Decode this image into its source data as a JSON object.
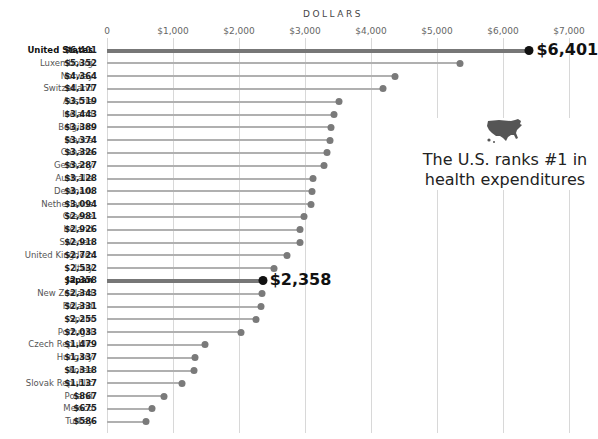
{
  "chart_data": {
    "type": "lollipop",
    "xlabel": "DOLLARS",
    "ylabel": "",
    "xlim": [
      0,
      7000
    ],
    "x_ticks": [
      "0",
      "$1,000",
      "$2,000",
      "$3,000",
      "$4,000",
      "$5,000",
      "$6,000",
      "$7,000"
    ],
    "grid": true,
    "categories": [
      "United States",
      "Luxembourg",
      "Norway",
      "Switzerland",
      "Austria",
      "Iceland",
      "Belgium",
      "France",
      "Canada",
      "Germany",
      "Australia",
      "Denmark",
      "Netherlands",
      "Greece",
      "Ireland",
      "Sweden",
      "United Kingdom",
      "Italy",
      "Japan",
      "New Zealand",
      "Finland",
      "Spain",
      "Portugal",
      "Czech Republic",
      "Hungary",
      "Korea",
      "Slovak Republic",
      "Poland",
      "Mexico",
      "Turkey"
    ],
    "values": [
      6401,
      5352,
      4364,
      4177,
      3519,
      3443,
      3389,
      3374,
      3326,
      3287,
      3128,
      3108,
      3094,
      2981,
      2926,
      2918,
      2724,
      2532,
      2358,
      2343,
      2331,
      2255,
      2033,
      1479,
      1337,
      1318,
      1137,
      867,
      675,
      586
    ],
    "value_labels": [
      "$6,401",
      "$5,352",
      "$4,364",
      "$4,177",
      "$3,519",
      "$3,443",
      "$3,389",
      "$3,374",
      "$3,326",
      "$3,287",
      "$3,128",
      "$3,108",
      "$3,094",
      "$2,981",
      "$2,926",
      "$2,918",
      "$2,724",
      "$2,532",
      "$2,358",
      "$2,343",
      "$2,331",
      "$2,255",
      "$2,033",
      "$1,479",
      "$1,337",
      "$1,318",
      "$1,137",
      "$867",
      "$675",
      "$586"
    ],
    "highlighted": [
      "United States",
      "Japan"
    ],
    "callouts": [
      {
        "country": "United States",
        "label": "$6,401"
      },
      {
        "country": "Japan",
        "label": "$2,358"
      }
    ],
    "annotations": [
      "The U.S. ranks #1 in",
      "health expenditures"
    ]
  },
  "axis": {
    "title": "DOLLARS",
    "ticks": [
      "0",
      "$1,000",
      "$2,000",
      "$3,000",
      "$4,000",
      "$5,000",
      "$6,000",
      "$7,000"
    ]
  },
  "annotation": {
    "icon": "usa-map-icon",
    "line1": "The U.S. ranks #1 in",
    "line2": "health expenditures"
  },
  "colors": {
    "stem": "#b0b0b0",
    "dot": "#7a7a7a",
    "highlight_stem": "#777777",
    "highlight_dot": "#111111",
    "grid": "#d8d8d8"
  }
}
